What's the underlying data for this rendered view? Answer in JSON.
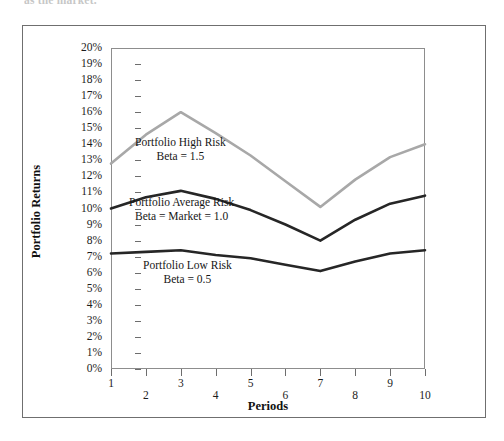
{
  "page": {
    "caption_fragment": "as the market."
  },
  "chart_data": {
    "type": "line",
    "title": "",
    "xlabel": "Periods",
    "ylabel": "Portfolio Returns",
    "x": [
      1,
      2,
      3,
      4,
      5,
      6,
      7,
      8,
      9,
      10
    ],
    "xtick_labels": [
      "1",
      "2",
      "3",
      "4",
      "5",
      "6",
      "7",
      "8",
      "9",
      "10"
    ],
    "ytick_labels": [
      "20%",
      "19%",
      "18%",
      "17%",
      "16%",
      "15%",
      "14%",
      "13%",
      "12%",
      "11%",
      "10%",
      "9%",
      "8%",
      "7%",
      "6%",
      "5%",
      "4%",
      "3%",
      "2%",
      "1%",
      "0%"
    ],
    "ylim": [
      0,
      20
    ],
    "xlim": [
      1,
      10
    ],
    "ytick_step": 1,
    "grid": false,
    "legend": "inline-annotations",
    "series": [
      {
        "name": "Portfolio High Risk",
        "beta_label": "Beta = 1.5",
        "color": "#a8a8a8",
        "values": [
          12.8,
          14.6,
          16.0,
          14.7,
          13.3,
          11.7,
          10.1,
          11.8,
          13.2,
          14.0
        ]
      },
      {
        "name": "Portfolio Average Risk",
        "beta_label": "Beta = Market = 1.0",
        "color": "#262626",
        "values": [
          10.0,
          10.7,
          11.1,
          10.6,
          9.9,
          9.0,
          8.0,
          9.3,
          10.3,
          10.8
        ]
      },
      {
        "name": "Portfolio Low Risk",
        "beta_label": "Beta = 0.5",
        "color": "#262626",
        "values": [
          7.2,
          7.3,
          7.4,
          7.1,
          6.9,
          6.5,
          6.1,
          6.7,
          7.2,
          7.4
        ]
      }
    ],
    "annotations": [
      {
        "text": "Portfolio High Risk",
        "subtext": "Beta = 1.5"
      },
      {
        "text": "Portfolio Average Risk",
        "subtext": "Beta = Market = 1.0"
      },
      {
        "text": "Portfolio Low Risk",
        "subtext": "Beta = 0.5"
      }
    ]
  }
}
